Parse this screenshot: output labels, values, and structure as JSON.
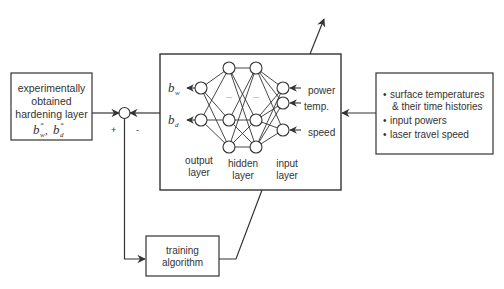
{
  "left_box": {
    "lines": [
      "experimentally",
      "obtained",
      "hardening layer"
    ],
    "math": "b*w, b*d",
    "math_bw": "b",
    "math_bw_sub": "w",
    "math_bd": "b",
    "math_bd_sub": "d",
    "sup": "*",
    "sep": ","
  },
  "junction": {
    "plus": "+",
    "minus": "-"
  },
  "network": {
    "outputs": [
      {
        "sym": "b",
        "sub": "w"
      },
      {
        "sym": "b",
        "sub": "d"
      }
    ],
    "inputs": [
      "power",
      "temp.",
      "speed"
    ],
    "ellipsis": "...",
    "layer_labels": {
      "output": [
        "output",
        "layer"
      ],
      "hidden": [
        "hidden",
        "layer"
      ],
      "input": [
        "input",
        "layer"
      ]
    }
  },
  "right_box": {
    "bullets": [
      [
        "surface temperatures",
        "& their time histories"
      ],
      [
        "input powers"
      ],
      [
        "laser travel speed"
      ]
    ],
    "bullet_glyph": "•"
  },
  "training_box": {
    "lines": [
      "training",
      "algorithm"
    ]
  },
  "colors": {
    "stroke": "#333333",
    "background": "#ffffff"
  }
}
